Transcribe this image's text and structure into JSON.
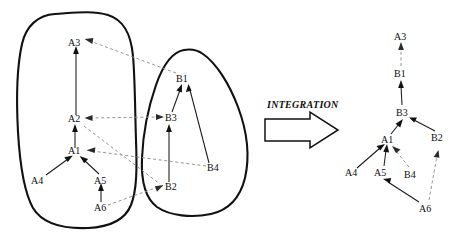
{
  "figure": {
    "background": "#ffffff",
    "width": 462,
    "height": 242
  },
  "colors": {
    "blob_stroke": "#111111",
    "solid_edge": "#1a1a1a",
    "dashed_edge": "#8e8e8e",
    "label_text": "#0d0d0d",
    "big_arrow_fill": "#ffffff",
    "big_arrow_stroke": "#111111"
  },
  "integration": {
    "label": "INTEGRATION",
    "arrow_name": "integration-arrow",
    "direction": "right"
  },
  "left_panel": {
    "name": "source-graphs",
    "groups": [
      {
        "name": "group-a",
        "shape": "rounded-blob",
        "nodes": [
          {
            "id": "A3",
            "label": "A3",
            "x": 76,
            "y": 42
          },
          {
            "id": "A2",
            "label": "A2",
            "x": 76,
            "y": 120
          },
          {
            "id": "A1",
            "label": "A1",
            "x": 76,
            "y": 152
          },
          {
            "id": "A4",
            "label": "A4",
            "x": 38,
            "y": 180
          },
          {
            "id": "A5",
            "label": "A5",
            "x": 100,
            "y": 180
          },
          {
            "id": "A6",
            "label": "A6",
            "x": 94,
            "y": 207
          }
        ],
        "edges": [
          {
            "from": "A2",
            "to": "A3",
            "style": "solid"
          },
          {
            "from": "A1",
            "to": "A2",
            "style": "solid"
          },
          {
            "from": "A4",
            "to": "A1",
            "style": "solid"
          },
          {
            "from": "A5",
            "to": "A1",
            "style": "solid"
          },
          {
            "from": "A6",
            "to": "A5",
            "style": "solid"
          }
        ]
      },
      {
        "name": "group-b",
        "shape": "teardrop-blob",
        "nodes": [
          {
            "id": "B1",
            "label": "B1",
            "x": 182,
            "y": 78
          },
          {
            "id": "B3",
            "label": "B3",
            "x": 170,
            "y": 118
          },
          {
            "id": "B4",
            "label": "B4",
            "x": 213,
            "y": 168
          },
          {
            "id": "B2",
            "label": "B2",
            "x": 170,
            "y": 187
          }
        ],
        "edges": [
          {
            "from": "B3",
            "to": "B1",
            "style": "solid"
          },
          {
            "from": "B4",
            "to": "B1",
            "style": "solid"
          },
          {
            "from": "B2",
            "to": "B3",
            "style": "solid"
          }
        ]
      }
    ],
    "cross_links": [
      {
        "from": "B1",
        "to": "A3",
        "style": "dashed",
        "arrows": "end"
      },
      {
        "from": "A2",
        "to": "B3",
        "style": "dashed",
        "arrows": "both"
      },
      {
        "from": "B4",
        "to": "A1",
        "style": "dashed",
        "arrows": "end"
      },
      {
        "from": "A6",
        "to": "B2",
        "style": "dashed",
        "arrows": "end"
      }
    ]
  },
  "right_panel": {
    "name": "integrated-graph",
    "nodes": [
      {
        "id": "A3",
        "label": "A3",
        "x": 400,
        "y": 36
      },
      {
        "id": "B1",
        "label": "B1",
        "x": 400,
        "y": 73
      },
      {
        "id": "B3",
        "label": "B3",
        "x": 403,
        "y": 112
      },
      {
        "id": "A1",
        "label": "A1",
        "x": 387,
        "y": 140
      },
      {
        "id": "B2",
        "label": "B2",
        "x": 437,
        "y": 138
      },
      {
        "id": "A4",
        "label": "A4",
        "x": 352,
        "y": 172
      },
      {
        "id": "A5",
        "label": "A5",
        "x": 380,
        "y": 172
      },
      {
        "id": "B4",
        "label": "B4",
        "x": 410,
        "y": 174
      },
      {
        "id": "A6",
        "label": "A6",
        "x": 425,
        "y": 208
      }
    ],
    "edges": [
      {
        "from": "B1",
        "to": "A3",
        "style": "dashed"
      },
      {
        "from": "B3",
        "to": "B1",
        "style": "solid"
      },
      {
        "from": "A1",
        "to": "B3",
        "style": "solid"
      },
      {
        "from": "B2",
        "to": "B3",
        "style": "solid"
      },
      {
        "from": "A4",
        "to": "A1",
        "style": "solid"
      },
      {
        "from": "A5",
        "to": "A1",
        "style": "solid"
      },
      {
        "from": "B4",
        "to": "A1",
        "style": "dashed"
      },
      {
        "from": "A6",
        "to": "A5",
        "style": "solid"
      },
      {
        "from": "A6",
        "to": "B2",
        "style": "dashed"
      }
    ]
  }
}
